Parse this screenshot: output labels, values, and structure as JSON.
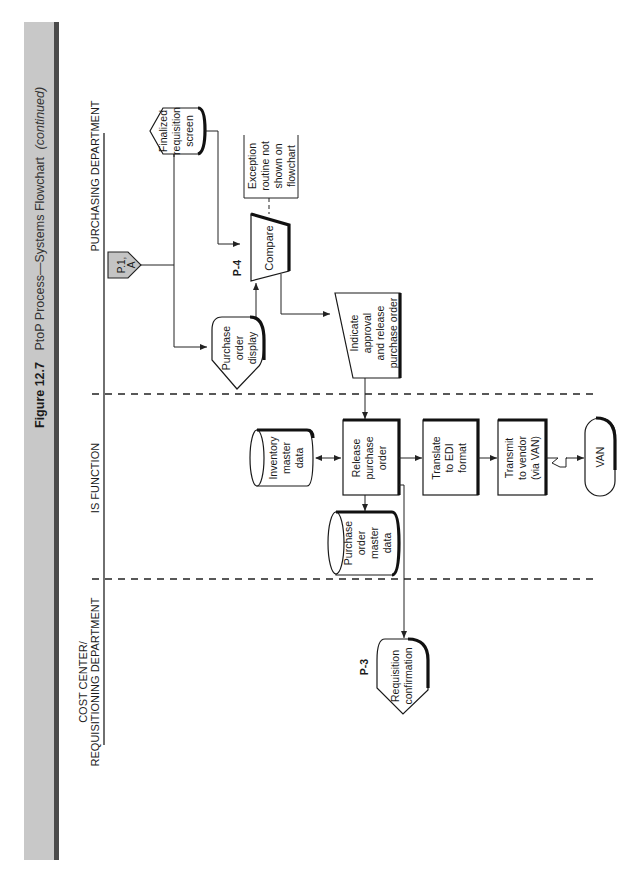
{
  "figure": {
    "number": "Figure 12.7",
    "title": "PtoP Process—Systems Flowchart",
    "subtitle": "(continued)",
    "colors": {
      "bar": "#c8c8c8",
      "stripe": "#4a4a4a",
      "connector_fill": "#c4c4c4"
    }
  },
  "lanes": {
    "purchasing": "PURCHASING DEPARTMENT",
    "is_function": "IS FUNCTION",
    "cost_center_line1": "COST CENTER/",
    "cost_center_line2": "REQUISITIONING DEPARTMENT"
  },
  "nodes": {
    "connector": {
      "line1": "P.1,",
      "line2": "A"
    },
    "finalized_screen": {
      "lines": [
        "Finalized",
        "requisition",
        "screen"
      ]
    },
    "exception": {
      "lines": [
        "Exception",
        "routine not",
        "shown on",
        "flowchart"
      ]
    },
    "compare": {
      "label": "Compare",
      "ref": "P-4"
    },
    "po_display": {
      "lines": [
        "Purchase",
        "order",
        "display"
      ]
    },
    "indicate_approval": {
      "lines": [
        "Indicate",
        "approval",
        "and release",
        "purchase order"
      ]
    },
    "inventory_master": {
      "lines": [
        "Inventory",
        "master",
        "data"
      ]
    },
    "release_po": {
      "lines": [
        "Release",
        "purchase",
        "order"
      ]
    },
    "po_master": {
      "lines": [
        "Purchase",
        "order",
        "master",
        "data"
      ]
    },
    "translate_edi": {
      "lines": [
        "Translate",
        "to EDI",
        "format"
      ]
    },
    "transmit_vendor": {
      "lines": [
        "Transmit",
        "to vendor",
        "(via VAN)"
      ]
    },
    "van": {
      "label": "VAN"
    },
    "req_confirmation": {
      "lines": [
        "Requisition",
        "confirmation"
      ],
      "ref": "P-3"
    }
  }
}
